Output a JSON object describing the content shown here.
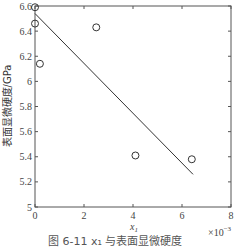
{
  "chart_data": {
    "type": "scatter",
    "title": "",
    "xlabel": "x1",
    "x_multiplier": "×10^-3",
    "ylabel": "表面显微硬度/GPa",
    "xlim": [
      0,
      8
    ],
    "ylim": [
      5,
      6.6
    ],
    "x_ticks": [
      0,
      2,
      4,
      6,
      8
    ],
    "y_ticks": [
      5,
      5.2,
      5.4,
      5.6,
      5.8,
      6,
      6.2,
      6.4,
      6.6
    ],
    "grid": false,
    "series": [
      {
        "name": "measured",
        "marker": "open-circle",
        "points": [
          {
            "x": 0.0,
            "y": 6.59
          },
          {
            "x": 0.0,
            "y": 6.46
          },
          {
            "x": 0.2,
            "y": 6.14
          },
          {
            "x": 2.5,
            "y": 6.43
          },
          {
            "x": 4.1,
            "y": 5.41
          },
          {
            "x": 6.4,
            "y": 5.38
          }
        ]
      },
      {
        "name": "fit",
        "type": "line",
        "points": [
          {
            "x": 0.0,
            "y": 6.54
          },
          {
            "x": 6.45,
            "y": 5.26
          }
        ]
      }
    ]
  },
  "labels": {
    "xlabel_main": "x",
    "xlabel_sub": "1",
    "multiplier_base": "×10",
    "multiplier_exp": "−3",
    "ylabel": "表面显微硬度/GPa",
    "caption": "图 6-11   x₁ 与表面显微硬度"
  }
}
